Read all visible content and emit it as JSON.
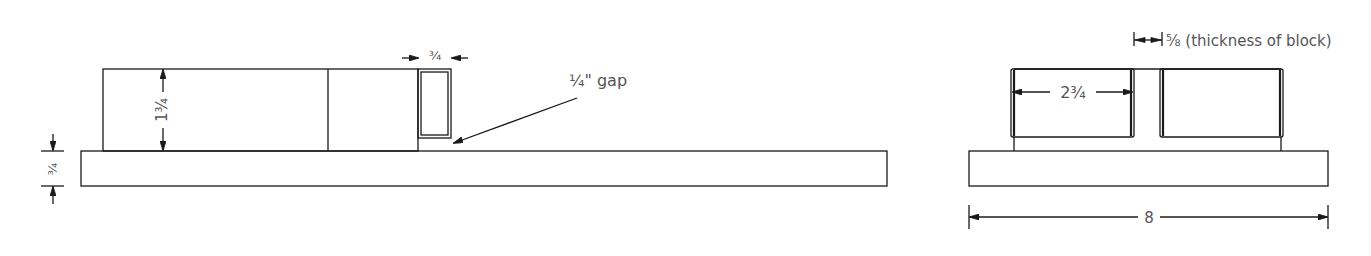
{
  "drawing": {
    "side_view": {
      "dim_base_thickness": "¾",
      "dim_block_height": "1¾",
      "dim_small_block_width": "¾",
      "gap_callout": "¼\" gap"
    },
    "end_view": {
      "dim_block_thickness": "⅝ (thickness of block)",
      "dim_block_width": "2¾",
      "dim_overall_width": "8"
    }
  },
  "colors": {
    "line": "#1a1a1a",
    "text": "#555555",
    "background": "#ffffff"
  }
}
